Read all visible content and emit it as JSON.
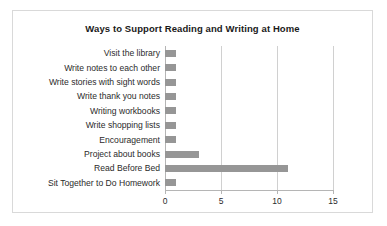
{
  "chart_data": {
    "type": "bar",
    "orientation": "horizontal",
    "title": "Ways to Support Reading and Writing at Home",
    "xlabel": "",
    "ylabel": "",
    "xlim": [
      0,
      15
    ],
    "xticks": [
      0,
      5,
      10,
      15
    ],
    "xtick_labels": [
      "0",
      "5",
      "10",
      "15"
    ],
    "grid": true,
    "legend": false,
    "bar_color": "#969696",
    "categories": [
      "Visit the library",
      "Write notes to each other",
      "Write stories with sight words",
      "Write thank you notes",
      "Writing workbooks",
      "Write shopping lists",
      "Encouragement",
      "Project about books",
      "Read Before Bed",
      "Sit Together to Do Homework"
    ],
    "values": [
      1,
      1,
      1,
      1,
      1,
      1,
      1,
      3,
      11,
      1
    ]
  }
}
